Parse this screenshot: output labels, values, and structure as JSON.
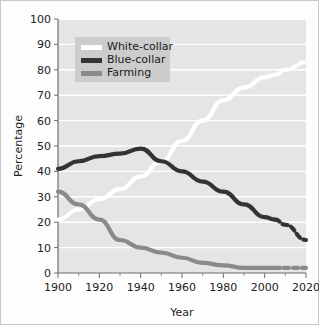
{
  "chart_data": {
    "type": "line",
    "title": "",
    "xlabel": "Year",
    "ylabel": "Percentage",
    "xlim": [
      1900,
      2020
    ],
    "ylim": [
      0,
      100
    ],
    "xticks": [
      1900,
      1920,
      1940,
      1960,
      1980,
      2000,
      2020
    ],
    "xtick_labels": [
      "1900",
      "1920",
      "1940",
      "1960",
      "1980",
      "2000",
      "2020"
    ],
    "xticks_minor": [
      1910,
      1930,
      1950,
      1970,
      1990,
      2010
    ],
    "yticks": [
      0,
      10,
      20,
      30,
      40,
      50,
      60,
      70,
      80,
      90,
      100
    ],
    "ytick_labels": [
      "0",
      "10",
      "20",
      "30",
      "40",
      "50",
      "60",
      "70",
      "80",
      "90",
      "100"
    ],
    "grid": "horizontal",
    "legend_position": "top-left",
    "projection_start_year": 2005,
    "series": [
      {
        "name": "White-collar",
        "color": "#ffffff",
        "x": [
          1900,
          1910,
          1920,
          1930,
          1940,
          1950,
          1960,
          1970,
          1980,
          1990,
          2000,
          2005,
          2010,
          2020
        ],
        "values": [
          21,
          25,
          29,
          33,
          38,
          44,
          52,
          60,
          68,
          73,
          77,
          78,
          80,
          83
        ]
      },
      {
        "name": "Blue-collar",
        "color": "#333333",
        "x": [
          1900,
          1910,
          1920,
          1930,
          1940,
          1950,
          1960,
          1970,
          1980,
          1990,
          2000,
          2005,
          2010,
          2020
        ],
        "values": [
          41,
          44,
          46,
          47,
          49,
          44,
          40,
          36,
          32,
          27,
          22,
          21,
          19,
          13
        ]
      },
      {
        "name": "Farming",
        "color": "#8a8a8a",
        "x": [
          1900,
          1910,
          1920,
          1930,
          1940,
          1950,
          1960,
          1970,
          1980,
          1990,
          2000,
          2005,
          2010,
          2020
        ],
        "values": [
          32,
          27,
          21,
          13,
          10,
          8,
          6,
          4,
          3,
          2,
          2,
          2,
          2,
          2
        ]
      }
    ]
  },
  "legend": {
    "items": [
      {
        "label": "White-collar",
        "color": "#ffffff"
      },
      {
        "label": "Blue-collar",
        "color": "#333333"
      },
      {
        "label": "Farming",
        "color": "#8a8a8a"
      }
    ]
  },
  "style": {
    "plot_background": "#e5e5e5",
    "gridline_color": "#ffffff",
    "axis_color": "#6d6d6d",
    "figure_background": "#fdfdfd",
    "legend_background": "#cccccc"
  }
}
